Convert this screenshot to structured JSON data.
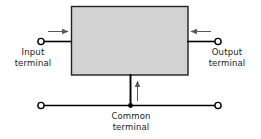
{
  "diagram": {
    "block": {
      "name": "device-block",
      "fill": "#d2d2d2",
      "stroke": "#231f20",
      "x": 71,
      "y": 6,
      "width": 117,
      "height": 69
    },
    "wires": [
      {
        "name": "input-wire",
        "from": [
          41,
          41
        ],
        "to": [
          71,
          41
        ]
      },
      {
        "name": "output-wire",
        "from": [
          188,
          41
        ],
        "to": [
          218,
          41
        ]
      },
      {
        "name": "common-drop-wire",
        "from": [
          130,
          75
        ],
        "to": [
          130,
          105
        ]
      },
      {
        "name": "common-bus-wire",
        "from": [
          41,
          105
        ],
        "to": [
          218,
          105
        ]
      }
    ],
    "terminals": [
      {
        "name": "input-terminal-node",
        "cx": 41,
        "cy": 41,
        "r": 3.1,
        "style": "open"
      },
      {
        "name": "output-terminal-node",
        "cx": 218,
        "cy": 41,
        "r": 3.1,
        "style": "open"
      },
      {
        "name": "common-terminal-node-left",
        "cx": 41,
        "cy": 105,
        "r": 3.1,
        "style": "open"
      },
      {
        "name": "common-terminal-node-right",
        "cx": 218,
        "cy": 105,
        "r": 3.1,
        "style": "open"
      },
      {
        "name": "common-junction-dot",
        "cx": 130,
        "cy": 105,
        "r": 2.4,
        "style": "filled"
      }
    ],
    "current_arrows": [
      {
        "name": "input-current-arrow",
        "direction": "right",
        "from": [
          48,
          32
        ],
        "to": [
          70,
          32
        ]
      },
      {
        "name": "output-current-arrow",
        "direction": "left",
        "from": [
          211,
          32
        ],
        "to": [
          189,
          32
        ]
      },
      {
        "name": "common-current-arrow",
        "direction": "up",
        "from": [
          137,
          101
        ],
        "to": [
          137,
          79
        ]
      }
    ],
    "labels": {
      "input": "Input\nterminal",
      "input_line1": "Input",
      "input_line2": "terminal",
      "output_line1": "Output",
      "output_line2": "terminal",
      "common_line1": "Common",
      "common_line2": "terminal"
    },
    "colors": {
      "wire": "#000000",
      "arrow": "#58595b",
      "text": "#1a1a1a",
      "block_fill": "#d2d2d2",
      "block_stroke": "#231f20",
      "background": "#ffffff"
    }
  }
}
